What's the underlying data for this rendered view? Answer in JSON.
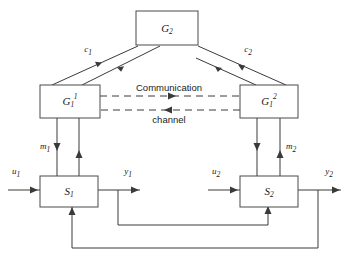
{
  "diagram": {
    "background_color": "#ffffff",
    "line_color": "#3a3a3a",
    "box_stroke_color": "#4a4a4a",
    "boxes": [
      {
        "id": "g2",
        "label": "G",
        "sub": "2",
        "sup": "",
        "x": 136,
        "y": 11,
        "w": 62,
        "h": 34
      },
      {
        "id": "g11",
        "label": "G",
        "sub": "1",
        "sup": "1",
        "x": 40,
        "y": 85,
        "w": 60,
        "h": 33
      },
      {
        "id": "g12",
        "label": "G",
        "sub": "1",
        "sup": "2",
        "x": 240,
        "y": 85,
        "w": 58,
        "h": 33
      },
      {
        "id": "s1",
        "label": "S",
        "sub": "1",
        "sup": "",
        "x": 40,
        "y": 176,
        "w": 58,
        "h": 31
      },
      {
        "id": "s2",
        "label": "S",
        "sub": "2",
        "sup": "",
        "x": 240,
        "y": 176,
        "w": 58,
        "h": 31
      }
    ],
    "signal_labels": [
      {
        "id": "c1",
        "text": "c",
        "sub": "1",
        "x": 88,
        "y": 52
      },
      {
        "id": "c2",
        "text": "c",
        "sub": "2",
        "x": 248,
        "y": 52
      },
      {
        "id": "m1",
        "text": "m",
        "sub": "1",
        "x": 45,
        "y": 149
      },
      {
        "id": "m2",
        "text": "m",
        "sub": "2",
        "x": 291,
        "y": 149
      },
      {
        "id": "u1",
        "text": "u",
        "sub": "1",
        "x": 16,
        "y": 174
      },
      {
        "id": "y1",
        "text": "y",
        "sub": "1",
        "x": 128,
        "y": 174
      },
      {
        "id": "u2",
        "text": "u",
        "sub": "2",
        "x": 216,
        "y": 174
      },
      {
        "id": "y2",
        "text": "y",
        "sub": "2",
        "x": 329,
        "y": 174
      }
    ],
    "channel": {
      "top_label": "Communication",
      "bottom_label": "channel",
      "top_label_x": 169,
      "top_label_y": 91,
      "bottom_label_x": 169,
      "bottom_label_y": 123
    }
  }
}
